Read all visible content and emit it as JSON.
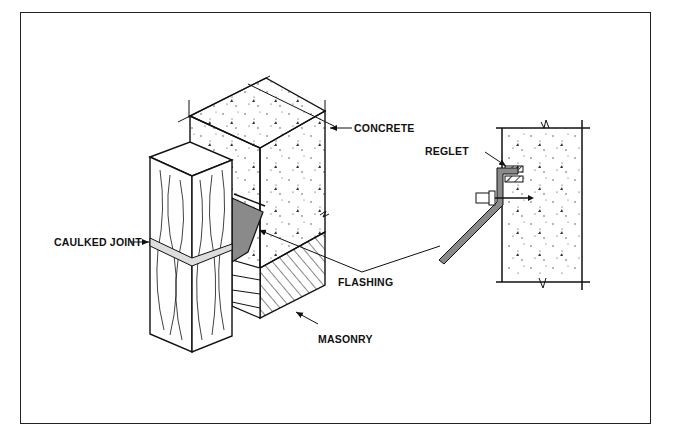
{
  "diagram": {
    "labels": {
      "concrete": "CONCRETE",
      "caulked_joint": "CAULKED JOINT",
      "flashing": "FLASHING",
      "masonry": "MASONRY",
      "reglet": "REGLET"
    },
    "colors": {
      "line": "#111111",
      "flashing_fill": "#8a8a8a",
      "background": "#ffffff"
    }
  }
}
